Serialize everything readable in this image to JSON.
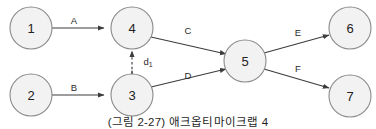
{
  "figure": {
    "caption": "(그림 2-27) 애크옵티마이크랩 4",
    "colors": {
      "node_fill": "#f2f2f2",
      "node_stroke": "#8a8a8a",
      "edge_stroke": "#3c3c3c",
      "background": "#ffffff",
      "text": "#222222"
    },
    "nodes": [
      {
        "id": "1",
        "label": "1",
        "cx": 31,
        "cy": 28,
        "r": 21
      },
      {
        "id": "2",
        "label": "2",
        "cx": 31,
        "cy": 95,
        "r": 21
      },
      {
        "id": "3",
        "label": "3",
        "cx": 132,
        "cy": 95,
        "r": 21
      },
      {
        "id": "4",
        "label": "4",
        "cx": 132,
        "cy": 28,
        "r": 21
      },
      {
        "id": "5",
        "label": "5",
        "cx": 245,
        "cy": 61,
        "r": 21
      },
      {
        "id": "6",
        "label": "6",
        "cx": 350,
        "cy": 28,
        "r": 21
      },
      {
        "id": "7",
        "label": "7",
        "cx": 350,
        "cy": 96,
        "r": 21
      }
    ],
    "edges": [
      {
        "id": "edge-a",
        "label": "A",
        "from": "1",
        "to": "4",
        "style": "solid",
        "label_x": 74,
        "label_y": 20
      },
      {
        "id": "edge-b",
        "label": "B",
        "from": "2",
        "to": "3",
        "style": "solid",
        "label_x": 74,
        "label_y": 87
      },
      {
        "id": "edge-c",
        "label": "C",
        "from": "4",
        "to": "5",
        "style": "solid",
        "label_x": 188,
        "label_y": 30
      },
      {
        "id": "edge-d",
        "label": "D",
        "from": "3",
        "to": "5",
        "style": "solid",
        "label_x": 188,
        "label_y": 75
      },
      {
        "id": "edge-e",
        "label": "E",
        "from": "5",
        "to": "6",
        "style": "solid",
        "label_x": 298,
        "label_y": 32
      },
      {
        "id": "edge-f",
        "label": "F",
        "from": "5",
        "to": "7",
        "style": "solid",
        "label_x": 298,
        "label_y": 68
      },
      {
        "id": "edge-d1",
        "label": "d",
        "label_subscript": "1",
        "from": "3",
        "to": "4",
        "style": "dashed",
        "label_x": 148,
        "label_y": 61
      }
    ]
  }
}
